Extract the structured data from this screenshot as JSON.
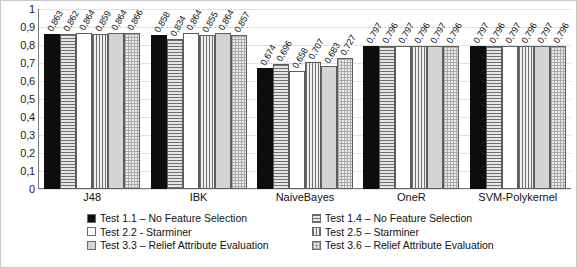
{
  "chart_data": {
    "type": "bar",
    "title": "",
    "xlabel": "",
    "ylabel": "",
    "ylim": [
      0,
      1
    ],
    "grid": true,
    "legend_position": "bottom",
    "categories": [
      "J48",
      "IBK",
      "NaiveBayes",
      "OneR",
      "SVM-Polykernel"
    ],
    "y_ticks": [
      "0",
      "0,1",
      "0,2",
      "0,3",
      "0,4",
      "0,5",
      "0,6",
      "0,7",
      "0,8",
      "0,9",
      "1"
    ],
    "series": [
      {
        "name": "Test 1.1 – No Feature Selection",
        "pattern": "solid-black",
        "values": [
          0.863,
          0.858,
          0.674,
          0.797,
          0.797
        ],
        "labels": [
          "0,863",
          "0,858",
          "0,674",
          "0,797",
          "0,797"
        ]
      },
      {
        "name": "Test 1.4 – No Feature Selection",
        "pattern": "hlines",
        "values": [
          0.862,
          0.834,
          0.696,
          0.796,
          0.796
        ],
        "labels": [
          "0,862",
          "0,834",
          "0,696",
          "0,796",
          "0,796"
        ]
      },
      {
        "name": "Test 2.2 - Starminer",
        "pattern": "white",
        "values": [
          0.864,
          0.864,
          0.658,
          0.797,
          0.797
        ],
        "labels": [
          "0,864",
          "0,864",
          "0,658",
          "0,797",
          "0,797"
        ]
      },
      {
        "name": "Test 2.5 – Starminer",
        "pattern": "vlines",
        "values": [
          0.859,
          0.855,
          0.707,
          0.796,
          0.796
        ],
        "labels": [
          "0,859",
          "0,855",
          "0,707",
          "0,796",
          "0,796"
        ]
      },
      {
        "name": "Test 3.3 – Relief Attribute Evaluation",
        "pattern": "lightgray",
        "values": [
          0.864,
          0.864,
          0.683,
          0.797,
          0.797
        ],
        "labels": [
          "0,864",
          "0,864",
          "0,683",
          "0,797",
          "0,797"
        ]
      },
      {
        "name": "Test 3.6 – Relief Attribute Evaluation",
        "pattern": "checker",
        "values": [
          0.866,
          0.857,
          0.727,
          0.796,
          0.796
        ],
        "labels": [
          "0,866",
          "0,857",
          "0,727",
          "0,796",
          "0,796"
        ]
      }
    ],
    "legend": [
      {
        "label": "Test 1.1 – No Feature Selection",
        "pattern": "solid-black"
      },
      {
        "label": "Test 1.4 – No Feature Selection",
        "pattern": "hlines"
      },
      {
        "label": "Test 2.2 - Starminer",
        "pattern": "white"
      },
      {
        "label": "Test 2.5 – Starminer",
        "pattern": "vlines"
      },
      {
        "label": "Test 3.3 – Relief Attribute Evaluation",
        "pattern": "lightgray"
      },
      {
        "label": "Test 3.6 – Relief Attribute Evaluation",
        "pattern": "checker"
      }
    ]
  }
}
